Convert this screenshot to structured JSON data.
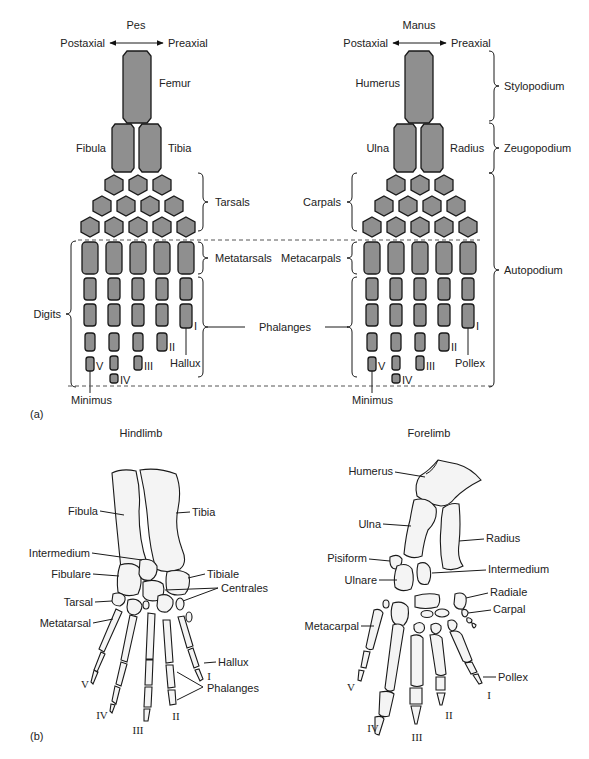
{
  "figure": {
    "panel_a_label": "(a)",
    "panel_b_label": "(b)",
    "panel_a": {
      "pes": {
        "title": "Pes",
        "postaxial": "Postaxial",
        "preaxial": "Preaxial",
        "femur": "Femur",
        "fibula": "Fibula",
        "tibia": "Tibia",
        "tarsals": "Tarsals",
        "metatarsals": "Metatarsals",
        "digits": "Digits",
        "hallux": "Hallux",
        "minimus": "Minimus",
        "digit_numerals": [
          "V",
          "IV",
          "III",
          "II",
          "I"
        ]
      },
      "center": {
        "phalanges": "Phalanges"
      },
      "manus": {
        "title": "Manus",
        "postaxial": "Postaxial",
        "preaxial": "Preaxial",
        "humerus": "Humerus",
        "ulna": "Ulna",
        "radius": "Radius",
        "carpals": "Carpals",
        "metacarpals": "Metacarpals",
        "pollex": "Pollex",
        "minimus": "Minimus",
        "digit_numerals": [
          "V",
          "IV",
          "III",
          "II",
          "I"
        ]
      },
      "regions": {
        "stylopodium": "Stylopodium",
        "zeugopodium": "Zeugopodium",
        "autopodium": "Autopodium"
      }
    },
    "panel_b": {
      "hindlimb": {
        "title": "Hindlimb",
        "fibula": "Fibula",
        "tibia": "Tibia",
        "intermedium": "Intermedium",
        "fibulare": "Fibulare",
        "tibiale": "Tibiale",
        "centrales": "Centrales",
        "tarsal": "Tarsal",
        "metatarsal": "Metatarsal",
        "hallux": "Hallux",
        "phalanges": "Phalanges",
        "digit_numerals": [
          "V",
          "IV",
          "III",
          "II",
          "I"
        ]
      },
      "forelimb": {
        "title": "Forelimb",
        "humerus": "Humerus",
        "ulna": "Ulna",
        "radius": "Radius",
        "pisiform": "Pisiform",
        "ulnare": "Ulnare",
        "intermedium": "Intermedium",
        "radiale": "Radiale",
        "carpal": "Carpal",
        "metacarpal": "Metacarpal",
        "pollex": "Pollex",
        "digit_numerals": [
          "V",
          "IV",
          "III",
          "II",
          "I"
        ]
      }
    },
    "colors": {
      "schematic_bone_fill": "#8f8f8f",
      "outline": "#1a1a1a",
      "background": "#ffffff"
    }
  }
}
